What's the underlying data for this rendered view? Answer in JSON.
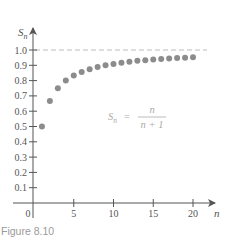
{
  "figure": {
    "caption": "Figure 8.10"
  },
  "colors": {
    "axis": "#555555",
    "points": "#8c8c8c",
    "asymptote": "#bbbbbb",
    "formula": "#aaaaaa",
    "caption": "#9a9a9a"
  },
  "formula": {
    "lhs": "S",
    "lhs_sub": "n",
    "equals": "=",
    "numerator": "n",
    "denominator": "n + 1"
  },
  "chart_data": {
    "type": "scatter",
    "title": "",
    "xlabel": "n",
    "ylabel": "S_n",
    "xlim": [
      0,
      21
    ],
    "ylim": [
      0,
      1.05
    ],
    "x_ticks": [
      5,
      10,
      15,
      20
    ],
    "x_tick_labels": [
      "5",
      "10",
      "15",
      "20"
    ],
    "origin_label": "0",
    "y_ticks": [
      0.1,
      0.2,
      0.3,
      0.4,
      0.5,
      0.6,
      0.7,
      0.8,
      0.9,
      1.0
    ],
    "y_tick_labels": [
      "0.1",
      "0.2",
      "0.3",
      "0.4",
      "0.5",
      "0.6",
      "0.7",
      "0.8",
      "0.9",
      "1.0"
    ],
    "grid": false,
    "annotations": [
      {
        "type": "formula",
        "text": "S_n = n/(n+1)"
      },
      {
        "type": "asymptote",
        "y": 1.0,
        "style": "dashed"
      }
    ],
    "series": [
      {
        "name": "S_n = n/(n+1)",
        "x": [
          1,
          2,
          3,
          4,
          5,
          6,
          7,
          8,
          9,
          10,
          11,
          12,
          13,
          14,
          15,
          16,
          17,
          18,
          19,
          20
        ],
        "y": [
          0.5,
          0.667,
          0.75,
          0.8,
          0.833,
          0.857,
          0.875,
          0.889,
          0.9,
          0.909,
          0.917,
          0.923,
          0.929,
          0.933,
          0.9375,
          0.941,
          0.944,
          0.947,
          0.95,
          0.952
        ]
      }
    ]
  }
}
